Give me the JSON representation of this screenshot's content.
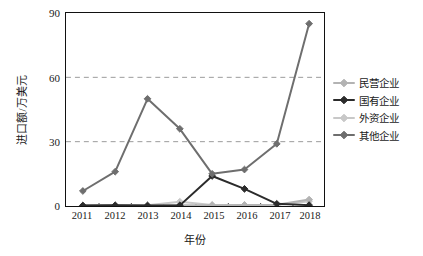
{
  "chart_data": {
    "type": "line",
    "title": "",
    "xlabel": "年份",
    "ylabel": "进口额/万美元",
    "categories": [
      "2011",
      "2012",
      "2013",
      "2014",
      "2015",
      "2016",
      "2017",
      "2018"
    ],
    "x": [
      2011,
      2012,
      2013,
      2014,
      2015,
      2016,
      2017,
      2018
    ],
    "ylim": [
      0,
      90
    ],
    "yticks": [
      0,
      30,
      60,
      90
    ],
    "ytick_labels": [
      "0",
      "30",
      "60",
      "90"
    ],
    "grid": "horizontal-dashed",
    "legend_position": "right",
    "series": [
      {
        "name": "民营企业",
        "color": "#b3b3b3",
        "marker": "diamond",
        "values": [
          0.3,
          0.4,
          0.3,
          0.4,
          0.4,
          0.5,
          0.6,
          3.0
        ]
      },
      {
        "name": "国有企业",
        "color": "#2b2b2b",
        "marker": "diamond",
        "values": [
          0.2,
          0.3,
          0.2,
          0.3,
          14.0,
          8.0,
          1.0,
          0.4
        ]
      },
      {
        "name": "外资企业",
        "color": "#c8c8c8",
        "marker": "diamond",
        "values": [
          0.2,
          0.3,
          0.3,
          2.0,
          0.5,
          0.4,
          0.4,
          2.2
        ]
      },
      {
        "name": "其他企业",
        "color": "#6e6e6e",
        "marker": "diamond",
        "values": [
          7.0,
          16.0,
          50.0,
          36.0,
          15.0,
          17.0,
          29.0,
          85.0
        ]
      }
    ]
  },
  "axis": {
    "y_title": "进口额/万美元",
    "x_title": "年份",
    "y_tick_0": "0",
    "y_tick_1": "30",
    "y_tick_2": "60",
    "y_tick_3": "90",
    "x_tick_0": "2011",
    "x_tick_1": "2012",
    "x_tick_2": "2013",
    "x_tick_3": "2014",
    "x_tick_4": "2015",
    "x_tick_5": "2016",
    "x_tick_6": "2017",
    "x_tick_7": "2018"
  },
  "legend": {
    "items": [
      {
        "label": "民营企业",
        "color": "#b3b3b3"
      },
      {
        "label": "国有企业",
        "color": "#2b2b2b"
      },
      {
        "label": "外资企业",
        "color": "#c8c8c8"
      },
      {
        "label": "其他企业",
        "color": "#6e6e6e"
      }
    ]
  },
  "style": {
    "frame_color": "#111111",
    "grid_color": "#9a9a9a",
    "background": "#ffffff",
    "text_color": "#1a1a1a"
  }
}
